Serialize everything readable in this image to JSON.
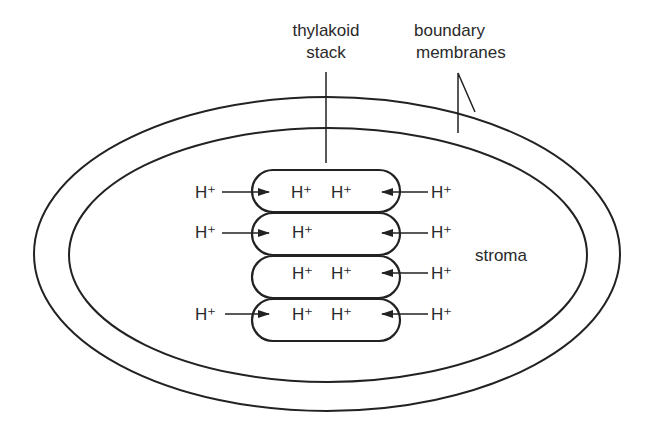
{
  "diagram": {
    "labels": {
      "thylakoid_stack_line1": "thylakoid",
      "thylakoid_stack_line2": "stack",
      "boundary_line1": "boundary",
      "boundary_line2": "membranes",
      "stroma": "stroma"
    },
    "proton": "H⁺",
    "rows": [
      {
        "left_ion": "H⁺",
        "left_arrow": true,
        "inside": [
          "H⁺",
          "H⁺"
        ],
        "right_ion": "H⁺",
        "right_arrow": true
      },
      {
        "left_ion": "H⁺",
        "left_arrow": true,
        "inside": [
          "H⁺"
        ],
        "right_ion": "H⁺",
        "right_arrow": true
      },
      {
        "left_ion": "",
        "left_arrow": false,
        "inside": [
          "H⁺",
          "H⁺"
        ],
        "right_ion": "H⁺",
        "right_arrow": true
      },
      {
        "left_ion": "H⁺",
        "left_arrow": true,
        "inside": [
          "H⁺",
          "H⁺"
        ],
        "right_ion": "H⁺",
        "right_arrow": true
      }
    ],
    "colors": {
      "stroke": "#222222",
      "text": "#2a2a2a",
      "background": "#ffffff"
    }
  }
}
